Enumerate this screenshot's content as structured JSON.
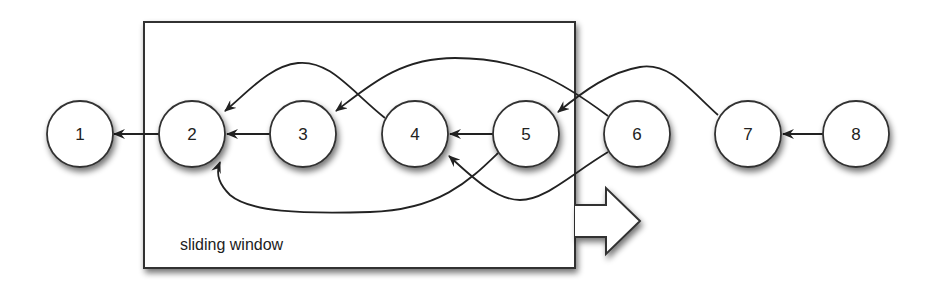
{
  "diagram": {
    "title": "",
    "window": {
      "label": "sliding window",
      "x": 144,
      "y": 22,
      "width": 431,
      "height": 246,
      "direction": "right"
    },
    "nodes": [
      {
        "id": "1",
        "label": "1",
        "cx": 80,
        "cy": 134,
        "in_window": false
      },
      {
        "id": "2",
        "label": "2",
        "cx": 192,
        "cy": 134,
        "in_window": true
      },
      {
        "id": "3",
        "label": "3",
        "cx": 303,
        "cy": 134,
        "in_window": true
      },
      {
        "id": "4",
        "label": "4",
        "cx": 415,
        "cy": 134,
        "in_window": true
      },
      {
        "id": "5",
        "label": "5",
        "cx": 526,
        "cy": 134,
        "in_window": true
      },
      {
        "id": "6",
        "label": "6",
        "cx": 637,
        "cy": 134,
        "in_window": false
      },
      {
        "id": "7",
        "label": "7",
        "cx": 748,
        "cy": 134,
        "in_window": false
      },
      {
        "id": "8",
        "label": "8",
        "cx": 856,
        "cy": 134,
        "in_window": false
      }
    ],
    "edges": [
      {
        "from": "2",
        "to": "1",
        "style": "straight"
      },
      {
        "from": "3",
        "to": "2",
        "style": "straight"
      },
      {
        "from": "4",
        "to": "2",
        "style": "curve-top"
      },
      {
        "from": "5",
        "to": "4",
        "style": "straight"
      },
      {
        "from": "5",
        "to": "2",
        "style": "curve-bottom"
      },
      {
        "from": "6",
        "to": "3",
        "style": "curve-top"
      },
      {
        "from": "6",
        "to": "4",
        "style": "curve-bottom"
      },
      {
        "from": "7",
        "to": "5",
        "style": "curve-top"
      },
      {
        "from": "8",
        "to": "7",
        "style": "straight"
      }
    ],
    "colors": {
      "stroke": "#222222",
      "node_fill": "#ffffff",
      "shadow": "#888888"
    }
  }
}
